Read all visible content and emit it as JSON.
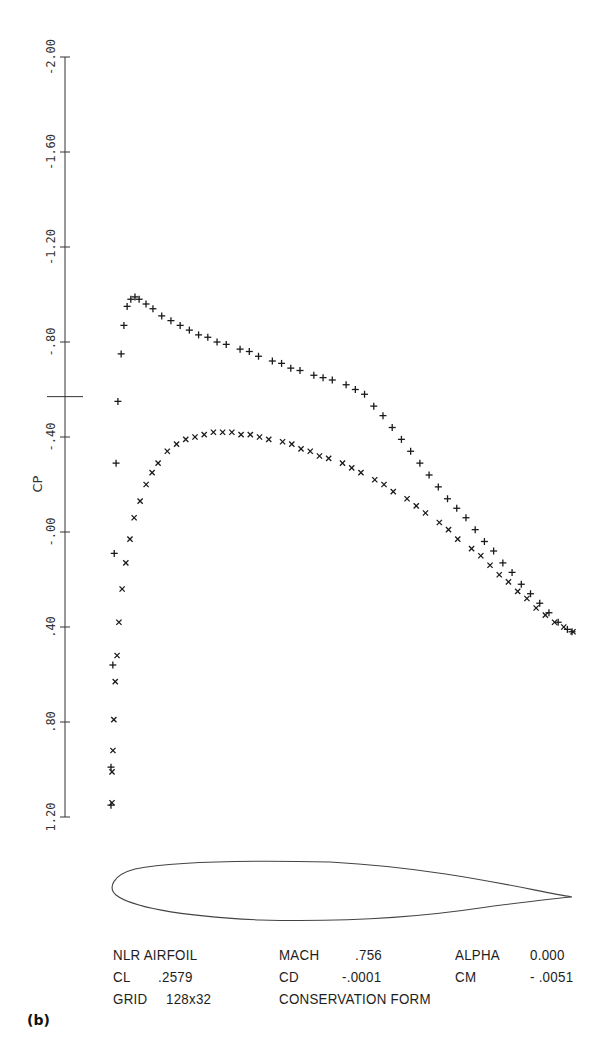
{
  "chart_data": {
    "type": "scatter",
    "title": "",
    "xlabel": "",
    "ylabel": "CP",
    "ylim": [
      -2.0,
      1.2
    ],
    "y_inverted": true,
    "y_ticks": [
      "-2.00",
      "-1.60",
      "-1.20",
      "-.80",
      "-.40",
      "-.00",
      ".40",
      ".80",
      "1.20"
    ],
    "y_tick_values": [
      -2.0,
      -1.6,
      -1.2,
      -0.8,
      -0.4,
      0.0,
      0.4,
      0.8,
      1.2
    ],
    "critical_cp_marker": -0.57,
    "grid": false,
    "legend": null,
    "series": [
      {
        "name": "upper surface",
        "marker": "+",
        "x": [
          0.0,
          0.0,
          0.004,
          0.007,
          0.011,
          0.015,
          0.022,
          0.028,
          0.035,
          0.043,
          0.052,
          0.061,
          0.076,
          0.091,
          0.11,
          0.13,
          0.15,
          0.17,
          0.19,
          0.21,
          0.23,
          0.25,
          0.28,
          0.3,
          0.32,
          0.35,
          0.37,
          0.39,
          0.41,
          0.44,
          0.46,
          0.48,
          0.51,
          0.53,
          0.55,
          0.57,
          0.59,
          0.61,
          0.63,
          0.65,
          0.67,
          0.69,
          0.71,
          0.73,
          0.75,
          0.77,
          0.79,
          0.81,
          0.83,
          0.85,
          0.87,
          0.89,
          0.91,
          0.93,
          0.95,
          0.97,
          0.99,
          1.0
        ],
        "values": [
          1.15,
          0.99,
          0.56,
          0.09,
          -0.29,
          -0.55,
          -0.75,
          -0.87,
          -0.95,
          -0.98,
          -0.99,
          -0.98,
          -0.96,
          -0.94,
          -0.91,
          -0.89,
          -0.87,
          -0.85,
          -0.83,
          -0.82,
          -0.8,
          -0.79,
          -0.77,
          -0.76,
          -0.74,
          -0.72,
          -0.71,
          -0.69,
          -0.68,
          -0.66,
          -0.65,
          -0.64,
          -0.62,
          -0.6,
          -0.58,
          -0.53,
          -0.49,
          -0.44,
          -0.39,
          -0.34,
          -0.29,
          -0.24,
          -0.19,
          -0.14,
          -0.1,
          -0.06,
          -0.01,
          0.04,
          0.08,
          0.13,
          0.17,
          0.22,
          0.26,
          0.3,
          0.34,
          0.38,
          0.41,
          0.42
        ]
      },
      {
        "name": "lower surface",
        "marker": "x",
        "x": [
          0.0,
          0.0,
          0.002,
          0.004,
          0.007,
          0.011,
          0.015,
          0.022,
          0.03,
          0.039,
          0.048,
          0.061,
          0.074,
          0.087,
          0.1,
          0.12,
          0.14,
          0.16,
          0.18,
          0.2,
          0.22,
          0.24,
          0.26,
          0.28,
          0.3,
          0.32,
          0.34,
          0.37,
          0.39,
          0.41,
          0.43,
          0.45,
          0.47,
          0.5,
          0.52,
          0.54,
          0.57,
          0.59,
          0.61,
          0.64,
          0.66,
          0.68,
          0.71,
          0.73,
          0.75,
          0.78,
          0.8,
          0.82,
          0.84,
          0.86,
          0.88,
          0.9,
          0.92,
          0.94,
          0.96,
          0.98,
          1.0
        ],
        "values": [
          1.14,
          1.01,
          0.92,
          0.79,
          0.63,
          0.52,
          0.38,
          0.24,
          0.13,
          0.03,
          -0.06,
          -0.13,
          -0.2,
          -0.25,
          -0.29,
          -0.34,
          -0.37,
          -0.39,
          -0.4,
          -0.41,
          -0.42,
          -0.42,
          -0.42,
          -0.41,
          -0.41,
          -0.4,
          -0.39,
          -0.38,
          -0.37,
          -0.35,
          -0.34,
          -0.32,
          -0.31,
          -0.29,
          -0.27,
          -0.25,
          -0.22,
          -0.2,
          -0.17,
          -0.14,
          -0.11,
          -0.08,
          -0.04,
          -0.01,
          0.03,
          0.07,
          0.1,
          0.14,
          0.18,
          0.21,
          0.25,
          0.28,
          0.32,
          0.35,
          0.38,
          0.4,
          0.42
        ]
      }
    ],
    "airfoil_sketch": true
  },
  "info": {
    "row1": {
      "name": "NLR AIRFOIL",
      "mach_label": "MACH",
      "mach_value": ".756",
      "alpha_label": "ALPHA",
      "alpha_value": "0.000"
    },
    "row2": {
      "cl_label": "CL",
      "cl_value": ".2579",
      "cd_label": "CD",
      "cd_value": "-.0001",
      "cm_label": "CM",
      "cm_value": "- .0051"
    },
    "row3": {
      "grid_label": "GRID",
      "grid_value": "128x32",
      "form": "CONSERVATION FORM"
    }
  },
  "panel_tag": "(b)"
}
